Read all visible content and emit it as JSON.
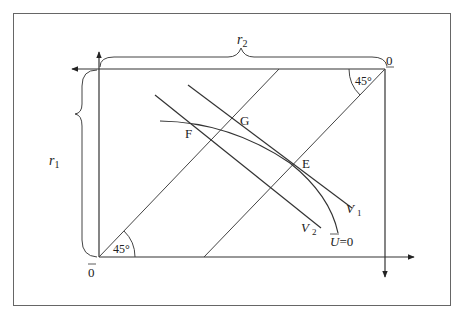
{
  "diagram": {
    "type": "edgeworth-box",
    "stroke_color": "#333333",
    "frame_color": "#555555",
    "labels": {
      "r2": "r",
      "r2_sub": "2",
      "r1": "r",
      "r1_sub": "1",
      "origin_top": "0",
      "origin_bottom": "0",
      "angle_top": "45°",
      "angle_bottom": "45°",
      "point_F": "F",
      "point_G": "G",
      "point_E": "E",
      "v1": "V",
      "v1_sub": "1",
      "v2": "V",
      "v2_sub": "2",
      "u_curve": "U",
      "u_curve_suffix": "=0"
    }
  }
}
